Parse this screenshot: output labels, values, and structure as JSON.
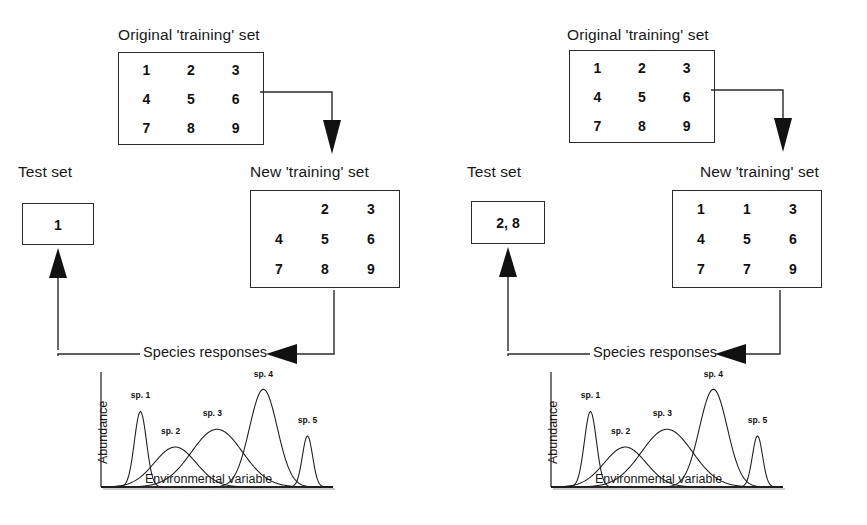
{
  "figure": {
    "line_color": "#2a2a2a",
    "arrow_color": "#111111",
    "background": "#ffffff"
  },
  "panels": [
    {
      "id": "leave-one-out",
      "original_set": {
        "caption": "Original 'training' set",
        "rows": [
          [
            "1",
            "2",
            "3"
          ],
          [
            "4",
            "5",
            "6"
          ],
          [
            "7",
            "8",
            "9"
          ]
        ]
      },
      "new_set": {
        "caption": "New 'training' set",
        "rows": [
          [
            "",
            "2",
            "3"
          ],
          [
            "4",
            "5",
            "6"
          ],
          [
            "7",
            "8",
            "9"
          ]
        ]
      },
      "test_set": {
        "caption": "Test set",
        "value": "1"
      },
      "species_label": "Species responses",
      "chart_data": {
        "type": "line",
        "title": "Species responses",
        "xlabel": "Environmental variable",
        "ylabel": "Abundance",
        "grid": false,
        "legend": "inline-annotations",
        "xlim": [
          0,
          100
        ],
        "ylim": [
          0,
          100
        ],
        "series": [
          {
            "name": "sp. 1",
            "label": "sp. 1",
            "optimum": 17,
            "tolerance": 2.6,
            "height": 68,
            "label_x": 17,
            "label_y": 80
          },
          {
            "name": "sp. 2",
            "label": "sp. 2",
            "optimum": 32,
            "tolerance": 9.0,
            "height": 36,
            "label_x": 30,
            "label_y": 48
          },
          {
            "name": "sp. 3",
            "label": "sp. 3",
            "optimum": 50,
            "tolerance": 11.0,
            "height": 52,
            "label_x": 48,
            "label_y": 64
          },
          {
            "name": "sp. 4",
            "label": "sp. 4",
            "optimum": 70,
            "tolerance": 6.0,
            "height": 88,
            "label_x": 70,
            "label_y": 99
          },
          {
            "name": "sp. 5",
            "label": "sp. 5",
            "optimum": 89,
            "tolerance": 2.2,
            "height": 46,
            "label_x": 89,
            "label_y": 58
          }
        ]
      }
    },
    {
      "id": "bootstrap",
      "original_set": {
        "caption": "Original 'training' set",
        "rows": [
          [
            "1",
            "2",
            "3"
          ],
          [
            "4",
            "5",
            "6"
          ],
          [
            "7",
            "8",
            "9"
          ]
        ]
      },
      "new_set": {
        "caption": "New 'training' set",
        "rows": [
          [
            "1",
            "1",
            "3"
          ],
          [
            "4",
            "5",
            "6"
          ],
          [
            "7",
            "7",
            "9"
          ]
        ]
      },
      "test_set": {
        "caption": "Test set",
        "value": "2, 8"
      },
      "species_label": "Species responses",
      "chart_data": {
        "type": "line",
        "title": "Species responses",
        "xlabel": "Environmental variable",
        "ylabel": "Abundance",
        "grid": false,
        "legend": "inline-annotations",
        "xlim": [
          0,
          100
        ],
        "ylim": [
          0,
          100
        ],
        "series": [
          {
            "name": "sp. 1",
            "label": "sp. 1",
            "optimum": 17,
            "tolerance": 2.6,
            "height": 68,
            "label_x": 17,
            "label_y": 80
          },
          {
            "name": "sp. 2",
            "label": "sp. 2",
            "optimum": 32,
            "tolerance": 9.0,
            "height": 36,
            "label_x": 30,
            "label_y": 48
          },
          {
            "name": "sp. 3",
            "label": "sp. 3",
            "optimum": 50,
            "tolerance": 11.0,
            "height": 52,
            "label_x": 48,
            "label_y": 64
          },
          {
            "name": "sp. 4",
            "label": "sp. 4",
            "optimum": 70,
            "tolerance": 6.0,
            "height": 88,
            "label_x": 70,
            "label_y": 99
          },
          {
            "name": "sp. 5",
            "label": "sp. 5",
            "optimum": 89,
            "tolerance": 2.2,
            "height": 46,
            "label_x": 89,
            "label_y": 58
          }
        ]
      }
    }
  ],
  "chart_data": [
    {
      "type": "line",
      "title": "Species responses (left panel)",
      "xlabel": "Environmental variable",
      "ylabel": "Abundance",
      "grid": false,
      "xlim": [
        0,
        100
      ],
      "ylim": [
        0,
        100
      ],
      "series": [
        {
          "name": "sp. 1",
          "optimum": 17,
          "tolerance": 2.6,
          "height": 68
        },
        {
          "name": "sp. 2",
          "optimum": 32,
          "tolerance": 9.0,
          "height": 36
        },
        {
          "name": "sp. 3",
          "optimum": 50,
          "tolerance": 11.0,
          "height": 52
        },
        {
          "name": "sp. 4",
          "optimum": 70,
          "tolerance": 6.0,
          "height": 88
        },
        {
          "name": "sp. 5",
          "optimum": 89,
          "tolerance": 2.2,
          "height": 46
        }
      ]
    },
    {
      "type": "line",
      "title": "Species responses (right panel)",
      "xlabel": "Environmental variable",
      "ylabel": "Abundance",
      "grid": false,
      "xlim": [
        0,
        100
      ],
      "ylim": [
        0,
        100
      ],
      "series": [
        {
          "name": "sp. 1",
          "optimum": 17,
          "tolerance": 2.6,
          "height": 68
        },
        {
          "name": "sp. 2",
          "optimum": 32,
          "tolerance": 9.0,
          "height": 36
        },
        {
          "name": "sp. 3",
          "optimum": 50,
          "tolerance": 11.0,
          "height": 52
        },
        {
          "name": "sp. 4",
          "optimum": 70,
          "tolerance": 6.0,
          "height": 88
        },
        {
          "name": "sp. 5",
          "optimum": 89,
          "tolerance": 2.2,
          "height": 46
        }
      ]
    }
  ]
}
